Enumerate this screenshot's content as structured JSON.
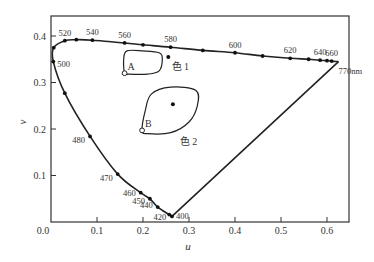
{
  "chart_data": {
    "type": "line",
    "title": "",
    "xlabel": "u",
    "ylabel": "v",
    "xlim": [
      0.0,
      0.65
    ],
    "ylim": [
      0.0,
      0.44
    ],
    "grid": false,
    "x_ticks": [
      "0.0",
      "0.1",
      "0.2",
      "0.3",
      "0.4",
      "0.5",
      "0.6"
    ],
    "x_tick_values": [
      0.0,
      0.1,
      0.2,
      0.3,
      0.4,
      0.5,
      0.6
    ],
    "y_ticks": [
      "0.1",
      "0.2",
      "0.3",
      "0.4"
    ],
    "y_tick_values": [
      0.1,
      0.2,
      0.3,
      0.4
    ],
    "spectral_locus": [
      {
        "u": 0.263,
        "v": 0.012,
        "label": "400"
      },
      {
        "u": 0.257,
        "v": 0.016,
        "label": "420"
      },
      {
        "u": 0.232,
        "v": 0.032,
        "label": "440"
      },
      {
        "u": 0.215,
        "v": 0.05,
        "label": "450"
      },
      {
        "u": 0.195,
        "v": 0.063,
        "label": "460"
      },
      {
        "u": 0.145,
        "v": 0.103,
        "label": "470"
      },
      {
        "u": 0.085,
        "v": 0.184,
        "label": "480"
      },
      {
        "u": 0.03,
        "v": 0.277,
        "label": ""
      },
      {
        "u": 0.005,
        "v": 0.345,
        "label": "500"
      },
      {
        "u": 0.006,
        "v": 0.375,
        "label": ""
      },
      {
        "u": 0.03,
        "v": 0.39,
        "label": "520"
      },
      {
        "u": 0.055,
        "v": 0.392,
        "label": ""
      },
      {
        "u": 0.09,
        "v": 0.391,
        "label": "540"
      },
      {
        "u": 0.16,
        "v": 0.385,
        "label": "560"
      },
      {
        "u": 0.2,
        "v": 0.381,
        "label": ""
      },
      {
        "u": 0.26,
        "v": 0.376,
        "label": "580"
      },
      {
        "u": 0.33,
        "v": 0.369,
        "label": ""
      },
      {
        "u": 0.4,
        "v": 0.364,
        "label": "600"
      },
      {
        "u": 0.46,
        "v": 0.357,
        "label": ""
      },
      {
        "u": 0.52,
        "v": 0.352,
        "label": "620"
      },
      {
        "u": 0.56,
        "v": 0.35,
        "label": ""
      },
      {
        "u": 0.585,
        "v": 0.348,
        "label": "640"
      },
      {
        "u": 0.6,
        "v": 0.347,
        "label": ""
      },
      {
        "u": 0.61,
        "v": 0.346,
        "label": "660"
      },
      {
        "u": 0.625,
        "v": 0.345,
        "label": "770nm"
      }
    ],
    "regions": [
      {
        "name": "色 1",
        "center": {
          "u": 0.255,
          "v": 0.355
        },
        "corner_point": {
          "u": 0.16,
          "v": 0.32,
          "label": "A"
        },
        "outline": [
          [
            0.16,
            0.32
          ],
          [
            0.158,
            0.35
          ],
          [
            0.165,
            0.368
          ],
          [
            0.2,
            0.368
          ],
          [
            0.235,
            0.364
          ],
          [
            0.242,
            0.35
          ],
          [
            0.235,
            0.325
          ],
          [
            0.21,
            0.318
          ],
          [
            0.17,
            0.318
          ]
        ]
      },
      {
        "name": "色 2",
        "center": {
          "u": 0.265,
          "v": 0.253
        },
        "corner_point": {
          "u": 0.198,
          "v": 0.197,
          "label": "B"
        },
        "outline": [
          [
            0.198,
            0.197
          ],
          [
            0.205,
            0.24
          ],
          [
            0.218,
            0.275
          ],
          [
            0.26,
            0.29
          ],
          [
            0.315,
            0.283
          ],
          [
            0.318,
            0.25
          ],
          [
            0.3,
            0.215
          ],
          [
            0.26,
            0.192
          ],
          [
            0.21,
            0.19
          ]
        ]
      }
    ]
  }
}
